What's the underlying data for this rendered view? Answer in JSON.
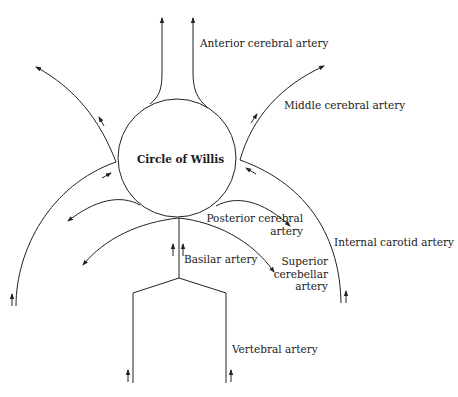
{
  "diagram": {
    "center_label": "Circle of Willis",
    "labels": {
      "anterior_cerebral": "Anterior cerebral artery",
      "middle_cerebral": "Middle cerebral artery",
      "posterior_cerebral_line1": "Posterior cerebral",
      "posterior_cerebral_line2": "artery",
      "internal_carotid": "Internal carotid artery",
      "basilar": "Basilar artery",
      "superior_cerebellar_line1": "Superior",
      "superior_cerebellar_line2": "cerebellar",
      "superior_cerebellar_line3": "artery",
      "vertebral": "Vertebral artery"
    },
    "colors": {
      "line": "#222222",
      "text": "#1a1a1a",
      "background": "#ffffff"
    }
  }
}
